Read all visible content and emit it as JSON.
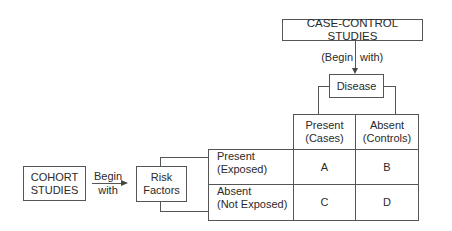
{
  "case_control": {
    "title": "CASE-CONTROL STUDIES",
    "begin_with_left": "(Begin",
    "begin_with_right": "with)"
  },
  "disease": {
    "label": "Disease"
  },
  "cohort": {
    "title_line1": "COHORT",
    "title_line2": "STUDIES",
    "begin_line1": "Begin",
    "begin_line2": "with"
  },
  "risk_factors": {
    "line1": "Risk",
    "line2": "Factors"
  },
  "table": {
    "columns": [
      {
        "line1": "Present",
        "line2": "(Cases)"
      },
      {
        "line1": "Absent",
        "line2": "(Controls)"
      }
    ],
    "rows": [
      {
        "line1": "Present",
        "line2": "(Exposed)",
        "cells": [
          "A",
          "B"
        ]
      },
      {
        "line1": "Absent",
        "line2": "(Not Exposed)",
        "cells": [
          "C",
          "D"
        ]
      }
    ]
  }
}
